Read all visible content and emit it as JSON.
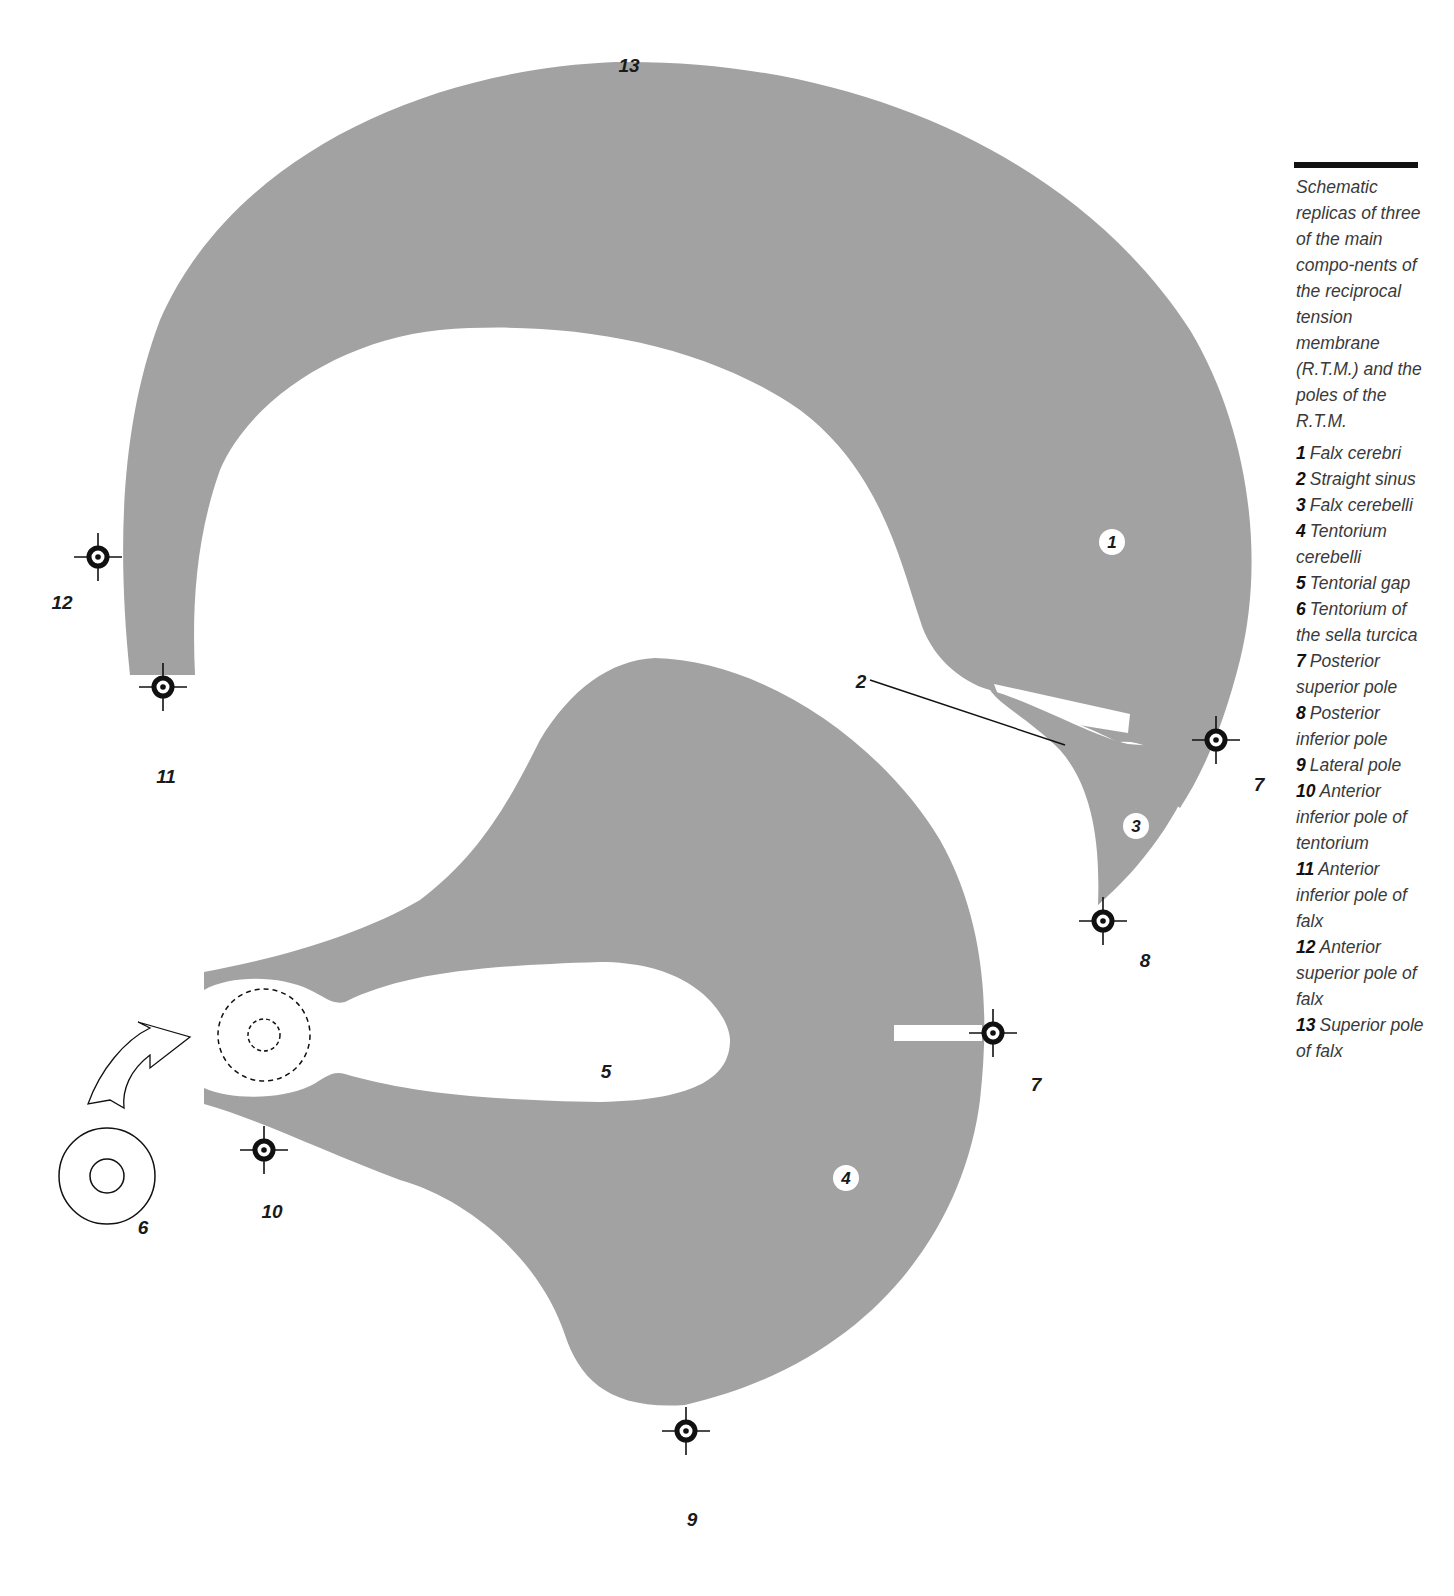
{
  "figure": {
    "colors": {
      "membrane_fill": "#a2a2a2",
      "background": "#ffffff",
      "ink": "#111111"
    },
    "labels": {
      "falx_cerebri_badge": "1",
      "straight_sinus": "2",
      "falx_cerebelli_badge": "3",
      "tentorium_cerebelli_badge": "4",
      "tentorial_gap": "5",
      "sella_turcica": "6",
      "posterior_superior_pole_falx": "7",
      "posterior_superior_pole_tentorium": "7",
      "posterior_inferior_pole": "8",
      "lateral_pole": "9",
      "anterior_inferior_pole_tentorium": "10",
      "anterior_inferior_pole_falx": "11",
      "anterior_superior_pole_falx": "12",
      "superior_pole_falx": "13"
    }
  },
  "caption": {
    "intro": "Schematic replicas of three of the main compo-nents of the reciprocal tension membrane (R.T.M.) and the poles of the R.T.M.",
    "legend": [
      {
        "num": "1",
        "text": "Falx cerebri"
      },
      {
        "num": "2",
        "text": "Straight sinus"
      },
      {
        "num": "3",
        "text": "Falx cerebelli"
      },
      {
        "num": "4",
        "text": "Tentorium cerebelli"
      },
      {
        "num": "5",
        "text": "Tentorial gap"
      },
      {
        "num": "6",
        "text": "Tentorium of the sella turcica"
      },
      {
        "num": "7",
        "text": "Posterior superior pole"
      },
      {
        "num": "8",
        "text": "Posterior inferior pole"
      },
      {
        "num": "9",
        "text": "Lateral pole"
      },
      {
        "num": "10",
        "text": "Anterior inferior pole of tentorium"
      },
      {
        "num": "11",
        "text": "Anterior inferior pole of falx"
      },
      {
        "num": "12",
        "text": "Anterior superior pole of falx"
      },
      {
        "num": "13",
        "text": "Superior pole of falx"
      }
    ]
  }
}
